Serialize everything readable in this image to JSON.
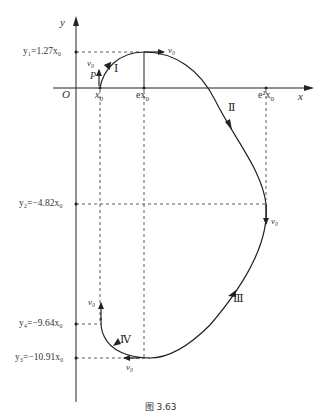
{
  "figure": {
    "caption": "图 3.63",
    "axes": {
      "x_label": "x",
      "y_label": "y",
      "origin_label": "O"
    },
    "x_ticks": [
      {
        "label_main": "x",
        "label_sub": "0",
        "id": "x0"
      },
      {
        "label_main": "ex",
        "label_sub": "0",
        "id": "e-x0"
      },
      {
        "label_main": "e²x",
        "label_sub": "0",
        "id": "e2-x0"
      }
    ],
    "y_ticks": [
      {
        "id": "y1",
        "text": "y₁=1.27x₀"
      },
      {
        "id": "y2",
        "text": "y₂=−4.82x₀"
      },
      {
        "id": "y4",
        "text": "y₄=−9.64x₀"
      },
      {
        "id": "y3",
        "text": "y₃=−10.91x₀"
      }
    ],
    "point_label": "P",
    "velocity_label": "v₀",
    "segments": [
      "Ⅰ",
      "Ⅱ",
      "Ⅲ",
      "Ⅳ"
    ],
    "colors": {
      "line": "#222222",
      "dashed": "#333333",
      "background": "#ffffff"
    }
  }
}
